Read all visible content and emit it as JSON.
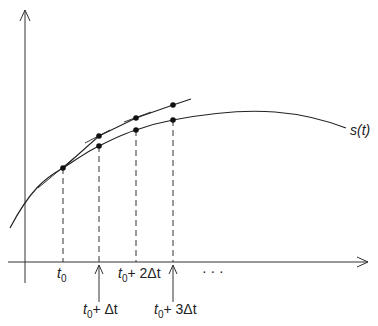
{
  "diagram": {
    "type": "euler-method-illustration",
    "curve_label": "s(t)",
    "x_ticks": [
      {
        "id": "t0",
        "base": "t",
        "sub": "0",
        "rest": "",
        "x": 63,
        "row": 1
      },
      {
        "id": "t0_plus_dt",
        "base": "t",
        "sub": "0",
        "rest": "+ Δt",
        "x": 99,
        "row": 2
      },
      {
        "id": "t0_plus_2dt",
        "base": "t",
        "sub": "0",
        "rest": "+ 2Δt",
        "x": 136,
        "row": 1
      },
      {
        "id": "t0_plus_3dt",
        "base": "t",
        "sub": "0",
        "rest": "+ 3Δt",
        "x": 173,
        "row": 2
      }
    ],
    "ellipsis": "· · ·",
    "true_curve_points": [
      [
        63,
        168
      ],
      [
        99,
        146
      ],
      [
        136,
        130
      ],
      [
        173,
        120
      ]
    ],
    "approx_points": [
      [
        63,
        168
      ],
      [
        99,
        136
      ],
      [
        136,
        118
      ],
      [
        173,
        105
      ]
    ],
    "labels": {
      "t0": "t",
      "t0_sub": "0",
      "t1_rest": "+ Δt",
      "t2_rest": "+ 2Δt",
      "t3_rest": "+ 3Δt",
      "curve": "s(t)",
      "ellipsis": "· · ·"
    },
    "colors": {
      "line": "#222222",
      "axis": "#333333",
      "background": "#ffffff"
    }
  }
}
